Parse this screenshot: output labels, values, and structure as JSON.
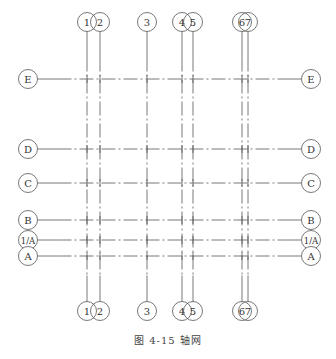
{
  "figure": {
    "caption": "图 4-15  轴网",
    "line_color": "#555555",
    "background": "#ffffff"
  },
  "vertical_axes": [
    {
      "label": "1",
      "x": 87
    },
    {
      "label": "2",
      "x": 100
    },
    {
      "label": "3",
      "x": 147
    },
    {
      "label": "4",
      "x": 182
    },
    {
      "label": "5",
      "x": 193
    },
    {
      "label": "6",
      "x": 242
    },
    {
      "label": "7",
      "x": 248
    }
  ],
  "horizontal_axes": [
    {
      "label": "E",
      "y": 79
    },
    {
      "label": "D",
      "y": 149
    },
    {
      "label": "C",
      "y": 183
    },
    {
      "label": "B",
      "y": 220
    },
    {
      "label": "1/A",
      "y": 240
    },
    {
      "label": "A",
      "y": 256
    }
  ],
  "layout": {
    "top_bubble_y": 22,
    "bottom_bubble_y": 311,
    "left_bubble_x": 28,
    "right_bubble_x": 311,
    "bubble_radius": 9.5
  }
}
